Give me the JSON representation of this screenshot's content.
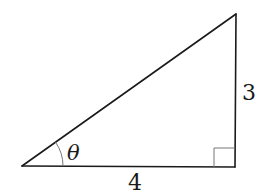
{
  "diagram": {
    "type": "right-triangle",
    "labels": {
      "angle": "θ",
      "opposite_side": "3",
      "adjacent_side": "4"
    },
    "colors": {
      "stroke": "#1a1a1a",
      "arc": "#777777",
      "right_angle_marker": "#777777",
      "background": "#ffffff"
    }
  }
}
